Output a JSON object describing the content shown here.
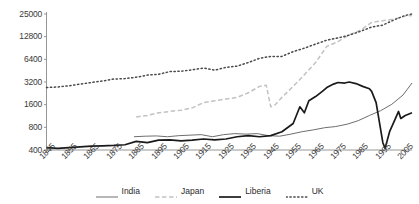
{
  "chart_data": {
    "type": "line",
    "title": "",
    "xlabel": "",
    "ylabel": "",
    "yscale": "log",
    "ylim": [
      400,
      25000
    ],
    "xlim": [
      1845,
      2008
    ],
    "grid": false,
    "legend_position": "bottom",
    "y_ticks": [
      400,
      800,
      1600,
      3200,
      6400,
      12800,
      25000
    ],
    "y_tick_labels": [
      "400",
      "800",
      "1600",
      "3200",
      "6400",
      "12800",
      "25000"
    ],
    "x_ticks": [
      1845,
      1855,
      1865,
      1875,
      1885,
      1895,
      1905,
      1915,
      1925,
      1935,
      1945,
      1955,
      1965,
      1975,
      1985,
      1995,
      2005
    ],
    "x_tick_labels": [
      "1845",
      "1855",
      "1865",
      "1875",
      "1885",
      "1895",
      "1905",
      "1915",
      "1925",
      "1935",
      "1945",
      "1955",
      "1965",
      "1975",
      "1985",
      "1995",
      "2005"
    ],
    "series": [
      {
        "name": "India",
        "style": "solid-thin",
        "color": "#6e6e6e",
        "x": [
          1884,
          1889,
          1894,
          1899,
          1904,
          1909,
          1914,
          1919,
          1924,
          1929,
          1934,
          1939,
          1944,
          1949,
          1954,
          1959,
          1964,
          1969,
          1974,
          1979,
          1984,
          1989,
          1994,
          1999,
          2004,
          2008
        ],
        "values": [
          600,
          610,
          615,
          600,
          620,
          630,
          640,
          600,
          640,
          660,
          650,
          660,
          620,
          610,
          650,
          700,
          740,
          790,
          820,
          880,
          980,
          1150,
          1330,
          1620,
          2150,
          3100
        ]
      },
      {
        "name": "Japan",
        "style": "dashed",
        "color": "#c2c2c2",
        "x": [
          1885,
          1890,
          1895,
          1900,
          1905,
          1910,
          1915,
          1920,
          1925,
          1930,
          1935,
          1940,
          1943,
          1945,
          1947,
          1950,
          1955,
          1960,
          1965,
          1970,
          1975,
          1980,
          1985,
          1990,
          1995,
          2000,
          2005,
          2008
        ],
        "values": [
          1100,
          1150,
          1250,
          1300,
          1350,
          1450,
          1700,
          1800,
          1900,
          2000,
          2300,
          2800,
          2900,
          1500,
          1600,
          2000,
          2800,
          4000,
          5800,
          9500,
          11000,
          13500,
          15500,
          19500,
          20500,
          21500,
          23500,
          24000
        ]
      },
      {
        "name": "Liberia",
        "style": "solid-thick",
        "color": "#1a1a1a",
        "x": [
          1845,
          1850,
          1855,
          1860,
          1865,
          1870,
          1875,
          1880,
          1885,
          1890,
          1895,
          1900,
          1905,
          1910,
          1915,
          1920,
          1925,
          1930,
          1935,
          1940,
          1945,
          1950,
          1955,
          1958,
          1960,
          1962,
          1965,
          1968,
          1970,
          1973,
          1975,
          1978,
          1980,
          1983,
          1986,
          1989,
          1990,
          1992,
          1995,
          1996,
          1998,
          2000,
          2002,
          2003,
          2005,
          2008
        ],
        "values": [
          430,
          420,
          430,
          440,
          450,
          455,
          460,
          470,
          520,
          500,
          540,
          545,
          530,
          540,
          560,
          545,
          560,
          600,
          620,
          600,
          620,
          700,
          900,
          1500,
          1250,
          1800,
          2050,
          2400,
          2700,
          3000,
          3150,
          3100,
          3200,
          3050,
          2800,
          2600,
          2400,
          1700,
          500,
          420,
          700,
          950,
          1300,
          1050,
          1150,
          1250
        ]
      },
      {
        "name": "UK",
        "style": "dotted",
        "color": "#4a4a4a",
        "x": [
          1845,
          1850,
          1855,
          1860,
          1865,
          1870,
          1875,
          1880,
          1885,
          1890,
          1895,
          1900,
          1905,
          1910,
          1915,
          1920,
          1925,
          1930,
          1935,
          1940,
          1945,
          1950,
          1955,
          1960,
          1965,
          1970,
          1975,
          1980,
          1985,
          1990,
          1995,
          2000,
          2005,
          2008
        ],
        "values": [
          2700,
          2750,
          2850,
          3000,
          3150,
          3300,
          3500,
          3550,
          3700,
          3950,
          4050,
          4400,
          4450,
          4650,
          4900,
          4600,
          5000,
          5200,
          5800,
          6600,
          7000,
          7000,
          8100,
          9000,
          10200,
          11500,
          12300,
          13400,
          15000,
          17000,
          18000,
          21000,
          24000,
          25000
        ]
      }
    ]
  },
  "legend": {
    "items": [
      {
        "label": "India"
      },
      {
        "label": "Japan"
      },
      {
        "label": "Liberia"
      },
      {
        "label": "UK"
      }
    ]
  }
}
